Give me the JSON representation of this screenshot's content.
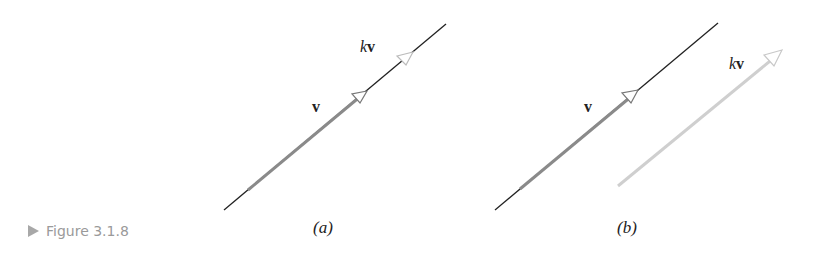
{
  "caption": {
    "label": "Figure 3.1.8",
    "icon": "triangle-right-icon"
  },
  "panels": [
    {
      "id": "a",
      "label": "(a)",
      "vector_label": "v",
      "scaled_label_k": "k",
      "scaled_label_v": "v"
    },
    {
      "id": "b",
      "label": "(b)",
      "vector_label": "v",
      "scaled_label_k": "k",
      "scaled_label_v": "v"
    }
  ],
  "colors": {
    "line": "#222222",
    "vector": "#8a8a8a",
    "scaled_vector": "#cfcfcf",
    "caption": "#9a9a9a"
  }
}
